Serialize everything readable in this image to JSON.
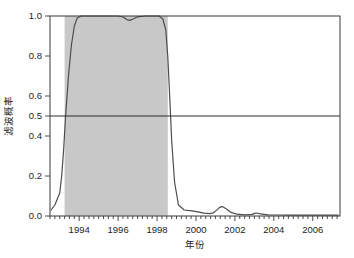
{
  "chart_data": {
    "type": "line",
    "title": "",
    "subtitle": "",
    "xlabel": "年份",
    "ylabel": "滤波概率",
    "xlim": [
      1992.5,
      2007.4
    ],
    "ylim": [
      0.0,
      1.0
    ],
    "grid": false,
    "legend": null,
    "x_tick_labels": [
      "1994",
      "1996",
      "1998",
      "2000",
      "2002",
      "2004",
      "2006"
    ],
    "x_tick_values": [
      1994,
      1996,
      1998,
      2000,
      2002,
      2004,
      2006
    ],
    "x_minor_tick_step": 0.25,
    "y_tick_labels": [
      "0.0",
      "0.2",
      "0.4",
      "0.5",
      "0.6",
      "0.8",
      "1.0"
    ],
    "y_tick_values": [
      0.0,
      0.2,
      0.4,
      0.5,
      0.6,
      0.8,
      1.0
    ],
    "annotations": [
      {
        "name": "threshold-line",
        "type": "hline",
        "y": 0.5,
        "label": "0.5"
      },
      {
        "name": "regime-shaded-band",
        "type": "vspan",
        "x0": 1993.25,
        "x1": 1998.55,
        "color": "#c8c8c8",
        "label": "高概率区间"
      }
    ],
    "series": [
      {
        "name": "滤波概率",
        "color": "#4d4d4d",
        "x": [
          1992.55,
          1992.75,
          1993.0,
          1993.1,
          1993.2,
          1993.3,
          1993.45,
          1993.6,
          1993.75,
          1993.9,
          1994.1,
          1994.5,
          1995.0,
          1995.5,
          1996.0,
          1996.25,
          1996.45,
          1996.6,
          1996.8,
          1997.0,
          1997.4,
          1997.8,
          1998.1,
          1998.3,
          1998.45,
          1998.55,
          1998.65,
          1998.75,
          1998.9,
          1999.1,
          1999.4,
          1999.8,
          2000.1,
          2000.4,
          2000.7,
          2000.9,
          2001.05,
          2001.2,
          2001.35,
          2001.55,
          2001.8,
          2002.1,
          2002.5,
          2002.9,
          2003.0,
          2003.1,
          2003.3,
          2003.7,
          2004.2,
          2004.8,
          2005.4,
          2006.0,
          2006.6,
          2007.3
        ],
        "y": [
          0.03,
          0.055,
          0.115,
          0.2,
          0.33,
          0.5,
          0.7,
          0.855,
          0.95,
          0.99,
          1.0,
          1.0,
          1.0,
          1.0,
          1.0,
          0.995,
          0.982,
          0.978,
          0.986,
          0.996,
          1.0,
          1.0,
          1.0,
          0.985,
          0.93,
          0.8,
          0.6,
          0.38,
          0.17,
          0.055,
          0.03,
          0.026,
          0.021,
          0.014,
          0.012,
          0.016,
          0.028,
          0.042,
          0.048,
          0.036,
          0.018,
          0.009,
          0.006,
          0.008,
          0.013,
          0.015,
          0.011,
          0.006,
          0.005,
          0.004,
          0.004,
          0.004,
          0.004,
          0.004
        ]
      }
    ]
  },
  "axes": {
    "x_axis_name": "year-axis",
    "y_axis_name": "probability-axis"
  }
}
